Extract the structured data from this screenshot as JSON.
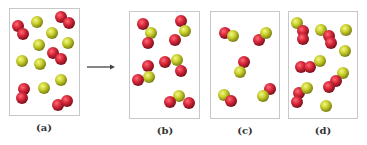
{
  "figure": {
    "colors": {
      "red_atom": "#d8283a",
      "red_atom_dark": "#7a0f1c",
      "yellow_atom": "#c8cf2a",
      "yellow_atom_dark": "#7d8212",
      "box_border": "#c8c8c8",
      "arrow": "#444444"
    },
    "panels": [
      {
        "id": "a",
        "label": "(a)",
        "contents": "5 red diatomic molecules (O2) and 8 yellow single atoms (S)",
        "atoms": [
          {
            "el": "O",
            "x": 18,
            "y": 26
          },
          {
            "el": "O",
            "x": 23,
            "y": 34
          },
          {
            "el": "O",
            "x": 61,
            "y": 17
          },
          {
            "el": "O",
            "x": 69,
            "y": 23
          },
          {
            "el": "O",
            "x": 53,
            "y": 53
          },
          {
            "el": "O",
            "x": 61,
            "y": 59
          },
          {
            "el": "O",
            "x": 24,
            "y": 89
          },
          {
            "el": "O",
            "x": 22,
            "y": 98
          },
          {
            "el": "O",
            "x": 58,
            "y": 105
          },
          {
            "el": "O",
            "x": 67,
            "y": 101
          },
          {
            "el": "S",
            "x": 37,
            "y": 22
          },
          {
            "el": "S",
            "x": 52,
            "y": 33
          },
          {
            "el": "S",
            "x": 68,
            "y": 43
          },
          {
            "el": "S",
            "x": 39,
            "y": 45
          },
          {
            "el": "S",
            "x": 22,
            "y": 61
          },
          {
            "el": "S",
            "x": 40,
            "y": 64
          },
          {
            "el": "S",
            "x": 61,
            "y": 80
          },
          {
            "el": "S",
            "x": 44,
            "y": 88
          }
        ]
      },
      {
        "id": "b",
        "label": "(b)",
        "contents": "5 bent triatomic molecules (SO2)",
        "atoms": [
          {
            "el": "O",
            "x": 143,
            "y": 24
          },
          {
            "el": "S",
            "x": 151,
            "y": 33
          },
          {
            "el": "O",
            "x": 148,
            "y": 43
          },
          {
            "el": "O",
            "x": 181,
            "y": 21
          },
          {
            "el": "S",
            "x": 185,
            "y": 31
          },
          {
            "el": "O",
            "x": 175,
            "y": 40
          },
          {
            "el": "O",
            "x": 148,
            "y": 66
          },
          {
            "el": "S",
            "x": 149,
            "y": 77
          },
          {
            "el": "O",
            "x": 138,
            "y": 80
          },
          {
            "el": "O",
            "x": 165,
            "y": 62
          },
          {
            "el": "S",
            "x": 177,
            "y": 60
          },
          {
            "el": "O",
            "x": 181,
            "y": 71
          },
          {
            "el": "S",
            "x": 179,
            "y": 96
          },
          {
            "el": "O",
            "x": 170,
            "y": 102
          },
          {
            "el": "O",
            "x": 189,
            "y": 103
          }
        ]
      },
      {
        "id": "c",
        "label": "(c)",
        "contents": "5 diatomic molecules (SO)",
        "atoms": [
          {
            "el": "O",
            "x": 225,
            "y": 33
          },
          {
            "el": "S",
            "x": 233,
            "y": 36
          },
          {
            "el": "O",
            "x": 259,
            "y": 40
          },
          {
            "el": "S",
            "x": 266,
            "y": 33
          },
          {
            "el": "O",
            "x": 244,
            "y": 62
          },
          {
            "el": "S",
            "x": 240,
            "y": 72
          },
          {
            "el": "S",
            "x": 224,
            "y": 95
          },
          {
            "el": "O",
            "x": 231,
            "y": 101
          },
          {
            "el": "O",
            "x": 270,
            "y": 89
          },
          {
            "el": "S",
            "x": 263,
            "y": 96
          }
        ]
      },
      {
        "id": "d",
        "label": "(d)",
        "contents": "Mix of SO2 molecules and leftover S atoms",
        "atoms": [
          {
            "el": "S",
            "x": 297,
            "y": 23
          },
          {
            "el": "O",
            "x": 303,
            "y": 31
          },
          {
            "el": "O",
            "x": 303,
            "y": 39
          },
          {
            "el": "S",
            "x": 321,
            "y": 30
          },
          {
            "el": "O",
            "x": 329,
            "y": 36
          },
          {
            "el": "O",
            "x": 331,
            "y": 43
          },
          {
            "el": "S",
            "x": 346,
            "y": 30
          },
          {
            "el": "S",
            "x": 345,
            "y": 51
          },
          {
            "el": "O",
            "x": 301,
            "y": 67
          },
          {
            "el": "O",
            "x": 310,
            "y": 67
          },
          {
            "el": "S",
            "x": 320,
            "y": 61
          },
          {
            "el": "S",
            "x": 343,
            "y": 73
          },
          {
            "el": "O",
            "x": 336,
            "y": 81
          },
          {
            "el": "O",
            "x": 329,
            "y": 87
          },
          {
            "el": "O",
            "x": 299,
            "y": 93
          },
          {
            "el": "S",
            "x": 307,
            "y": 88
          },
          {
            "el": "O",
            "x": 297,
            "y": 102
          },
          {
            "el": "S",
            "x": 326,
            "y": 106
          }
        ]
      }
    ]
  }
}
